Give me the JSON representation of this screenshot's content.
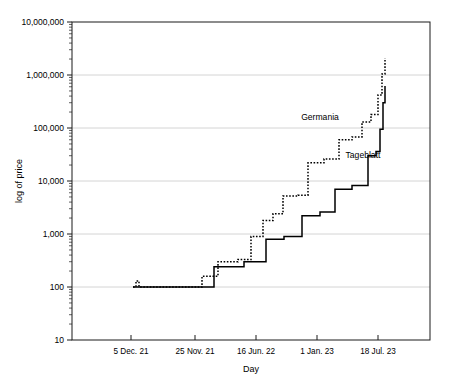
{
  "chart_data": {
    "type": "line",
    "title": "",
    "xlabel": "Day",
    "ylabel": "log of price",
    "yscale": "log",
    "ylim": [
      10,
      10000000
    ],
    "grid": true,
    "legend_position": "inline-annotation",
    "ytick_labels": [
      "10,000,000",
      "1,000,000",
      "100,000",
      "10,000",
      "1,000",
      "100",
      "10"
    ],
    "ytick_values": [
      10000000,
      1000000,
      100000,
      10000,
      1000,
      100,
      10
    ],
    "xtick_labels": [
      "5 Dec. 21",
      "25 Nov. 21",
      "16 Jun. 22",
      "1 Jan. 23",
      "18 Jul. 23"
    ],
    "xtick_positions": [
      131,
      195,
      256,
      317,
      378
    ],
    "series": [
      {
        "name": "Germania",
        "style": "dotted",
        "label_x": 320,
        "label_y": 120,
        "points": [
          [
            133,
            100
          ],
          [
            136,
            130
          ],
          [
            139,
            100
          ],
          [
            146,
            100
          ],
          [
            156,
            100
          ],
          [
            166,
            100
          ],
          [
            176,
            100
          ],
          [
            186,
            100
          ],
          [
            196,
            100
          ],
          [
            200,
            100
          ],
          [
            202,
            160
          ],
          [
            213,
            160
          ],
          [
            216,
            160
          ],
          [
            218,
            300
          ],
          [
            232,
            300
          ],
          [
            236,
            300
          ],
          [
            238,
            330
          ],
          [
            246,
            330
          ],
          [
            249,
            330
          ],
          [
            251,
            900
          ],
          [
            258,
            900
          ],
          [
            261,
            900
          ],
          [
            263,
            1800
          ],
          [
            268,
            1800
          ],
          [
            271,
            1800
          ],
          [
            273,
            2400
          ],
          [
            278,
            2400
          ],
          [
            281,
            2400
          ],
          [
            283,
            5200
          ],
          [
            292,
            5200
          ],
          [
            296,
            5200
          ],
          [
            298,
            5400
          ],
          [
            303,
            5400
          ],
          [
            306,
            5400
          ],
          [
            308,
            22000
          ],
          [
            318,
            22000
          ],
          [
            322,
            22000
          ],
          [
            324,
            26000
          ],
          [
            333,
            26000
          ],
          [
            337,
            26000
          ],
          [
            339,
            60000
          ],
          [
            346,
            60000
          ],
          [
            350,
            60000
          ],
          [
            352,
            68000
          ],
          [
            357,
            68000
          ],
          [
            360,
            68000
          ],
          [
            362,
            130000
          ],
          [
            366,
            130000
          ],
          [
            369,
            130000
          ],
          [
            371,
            180000
          ],
          [
            374,
            180000
          ],
          [
            376,
            180000
          ],
          [
            378,
            420000
          ],
          [
            380,
            420000
          ],
          [
            381,
            420000
          ],
          [
            382,
            1050000
          ],
          [
            383,
            1050000
          ],
          [
            384,
            1050000
          ],
          [
            385,
            2100000
          ]
        ]
      },
      {
        "name": "Tageblatt",
        "style": "solid",
        "label_x": 363,
        "label_y": 158,
        "points": [
          [
            133,
            100
          ],
          [
            150,
            100
          ],
          [
            170,
            100
          ],
          [
            190,
            100
          ],
          [
            205,
            100
          ],
          [
            212,
            100
          ],
          [
            214,
            240
          ],
          [
            226,
            240
          ],
          [
            236,
            240
          ],
          [
            242,
            240
          ],
          [
            244,
            300
          ],
          [
            252,
            300
          ],
          [
            260,
            300
          ],
          [
            264,
            300
          ],
          [
            266,
            800
          ],
          [
            272,
            800
          ],
          [
            278,
            800
          ],
          [
            282,
            800
          ],
          [
            284,
            900
          ],
          [
            290,
            900
          ],
          [
            296,
            900
          ],
          [
            300,
            900
          ],
          [
            302,
            2200
          ],
          [
            308,
            2200
          ],
          [
            314,
            2200
          ],
          [
            318,
            2200
          ],
          [
            320,
            2600
          ],
          [
            325,
            2600
          ],
          [
            330,
            2600
          ],
          [
            333,
            2600
          ],
          [
            335,
            7000
          ],
          [
            341,
            7000
          ],
          [
            346,
            7000
          ],
          [
            350,
            7000
          ],
          [
            352,
            8200
          ],
          [
            357,
            8200
          ],
          [
            362,
            8200
          ],
          [
            366,
            8200
          ],
          [
            368,
            30000
          ],
          [
            372,
            30000
          ],
          [
            374,
            30000
          ],
          [
            376,
            36000
          ],
          [
            378,
            36000
          ],
          [
            379,
            36000
          ],
          [
            380,
            95000
          ],
          [
            381,
            95000
          ],
          [
            382,
            95000
          ],
          [
            383,
            300000
          ],
          [
            384,
            300000
          ],
          [
            385,
            620000
          ]
        ]
      }
    ]
  },
  "plot_geometry": {
    "left": 72,
    "right": 430,
    "top": 22,
    "bottom": 340
  },
  "colors": {
    "ink": "#000000",
    "grid": "#c9c9c9",
    "frame": "#1a1a1a",
    "background": "#ffffff"
  }
}
